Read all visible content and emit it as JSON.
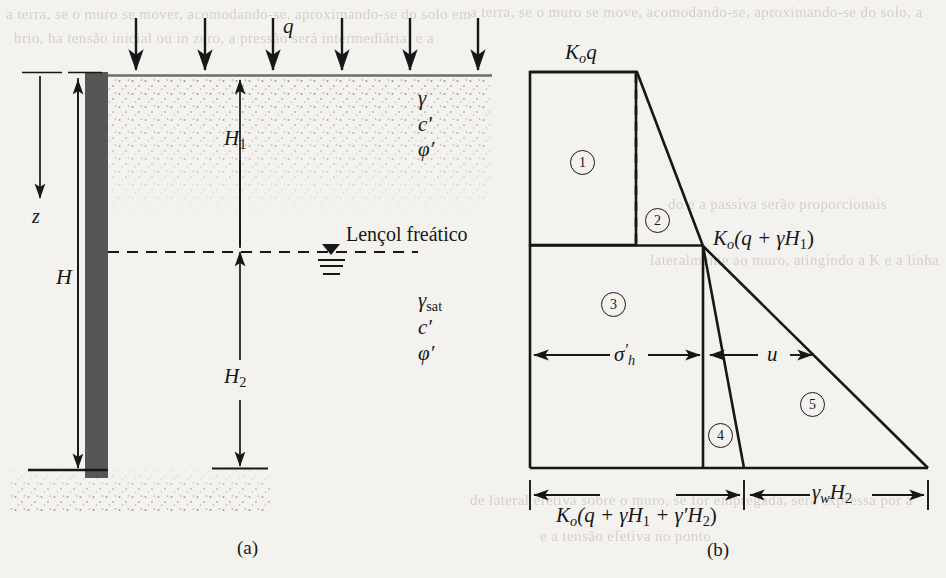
{
  "figure": {
    "type": "geotechnical-lateral-earth-pressure-diagram",
    "panels": [
      {
        "id": "a",
        "caption": "(a)",
        "description": "retaining wall with surcharge and water table"
      },
      {
        "id": "b",
        "caption": "(b)",
        "description": "lateral pressure distribution blocks"
      }
    ]
  },
  "panel_a": {
    "surcharge_label": "q",
    "surcharge_arrow_count": 6,
    "depth_axis_label": "z",
    "total_height_label": "H",
    "layer1_height_label": "H",
    "layer1_height_sub": "1",
    "layer2_height_label": "H",
    "layer2_height_sub": "2",
    "water_table_label": "Lençol freático",
    "upper_soil_props": [
      {
        "symbol": "γ",
        "sub": ""
      },
      {
        "symbol": "c",
        "sub": "′"
      },
      {
        "symbol": "φ",
        "sub": "′"
      }
    ],
    "lower_soil_props": [
      {
        "symbol": "γ",
        "sub": "sat"
      },
      {
        "symbol": "c",
        "sub": "′"
      },
      {
        "symbol": "φ",
        "sub": "′"
      }
    ]
  },
  "panel_b": {
    "top_pressure_label": "K",
    "top_pressure_sub": "o",
    "top_pressure_rest": "q",
    "mid_pressure_label": "K",
    "mid_pressure_sub": "o",
    "mid_pressure_rest": "(q + γH",
    "mid_pressure_sub2": "1",
    "mid_pressure_tail": ")",
    "effective_stress_label": "σ",
    "effective_stress_prime": "′",
    "effective_stress_sub": "h",
    "pore_pressure_label": "u",
    "bottom_effective_label": "K",
    "bottom_effective_sub": "o",
    "bottom_effective_rest": "(q + γH",
    "bottom_effective_sub2": "1",
    "bottom_effective_rest2": " + γ′H",
    "bottom_effective_sub3": "2",
    "bottom_effective_tail": ")",
    "bottom_water_label": "γ",
    "bottom_water_sub": "w",
    "bottom_water_rest": "H",
    "bottom_water_sub2": "2",
    "regions": [
      {
        "number": "1"
      },
      {
        "number": "2"
      },
      {
        "number": "3"
      },
      {
        "number": "4"
      },
      {
        "number": "5"
      }
    ]
  },
  "bleed_text": [
    {
      "text": "a terra, se o muro se mover, acomodando-se, aproximando-se do solo em",
      "x": 6,
      "y": 6
    },
    {
      "text": "brio, ha tensão inicial ou  in zero, a pressão será intermediária; e a",
      "x": 14,
      "y": 30
    },
    {
      "text": "a terra, se o muro se move, acomodando-se, aproximando-se do solo, a",
      "x": 470,
      "y": 4
    },
    {
      "text": "do e a passiva serão proporcionais",
      "x": 668,
      "y": 196
    },
    {
      "text": "lateralmente ao muro, atingindo a K e a linha",
      "x": 650,
      "y": 252
    },
    {
      "text": "de lateral efetiva sobre o muro, se for empregada, será expressa por a",
      "x": 470,
      "y": 492
    },
    {
      "text": "e a tensão efetiva no ponto",
      "x": 540,
      "y": 528
    }
  ],
  "colors": {
    "paper": "#f4f2ef",
    "ink": "#171717",
    "wall_fill": "#565656",
    "soil_dots": "#b6b1ab",
    "bleed": "#cfcac4"
  }
}
